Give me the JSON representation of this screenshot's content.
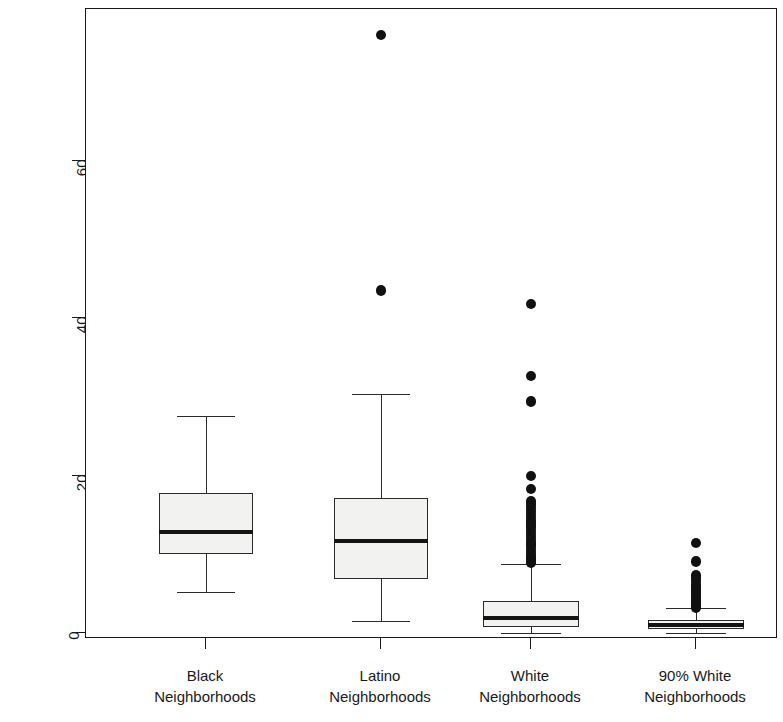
{
  "chart_data": {
    "type": "box",
    "title": "",
    "xlabel": "",
    "ylabel": "Prison Admission Rate",
    "ylim": [
      -1.5,
      79
    ],
    "yticks": [
      0,
      20,
      40,
      60
    ],
    "ytick_labels": [
      "0",
      "20",
      "40",
      "60"
    ],
    "grid": false,
    "legend": "none",
    "categories": [
      "Black\nNeighborhoods",
      "Latino\nNeighborhoods",
      "White\nNeighborhoods",
      "90% White\nNeighborhoods"
    ],
    "boxes": [
      {
        "name": "Black Neighborhoods",
        "label_line1": "Black",
        "label_line2": "Neighborhoods",
        "whisker_low": 5.2,
        "q1": 10.0,
        "median": 12.8,
        "q3": 17.8,
        "whisker_high": 27.5,
        "outliers": []
      },
      {
        "name": "Latino Neighborhoods",
        "label_line1": "Latino",
        "label_line2": "Neighborhoods",
        "whisker_low": 1.5,
        "q1": 6.9,
        "median": 11.7,
        "q3": 17.2,
        "whisker_high": 30.3,
        "outliers": [
          75.9,
          43.5
        ]
      },
      {
        "name": "White Neighborhoods",
        "label_line1": "White",
        "label_line2": "Neighborhoods",
        "whisker_low": 0.0,
        "q1": 0.7,
        "median": 1.9,
        "q3": 4.1,
        "whisker_high": 8.8,
        "outliers": [
          41.8,
          32.6,
          29.4,
          19.9,
          18.3,
          16.7,
          16.3,
          15.9,
          15.5,
          15.1,
          14.7,
          14.3,
          13.9,
          13.5,
          13.1,
          12.7,
          12.3,
          11.9,
          11.5,
          11.1,
          10.7,
          10.3,
          9.9,
          9.6,
          9.3,
          9.1,
          8.9
        ]
      },
      {
        "name": "90% White Neighborhoods",
        "label_line1": "90% White",
        "label_line2": "Neighborhoods",
        "whisker_low": 0.0,
        "q1": 0.5,
        "median": 1.0,
        "q3": 1.7,
        "whisker_high": 3.2,
        "outliers": [
          11.4,
          9.1,
          7.3,
          6.9,
          6.5,
          6.1,
          5.8,
          5.5,
          5.2,
          4.9,
          4.6,
          4.3,
          4.0,
          3.7,
          3.4,
          3.25
        ]
      }
    ]
  },
  "axis": {
    "y_label": "Prison Admission Rate",
    "y_ticks": [
      "0",
      "20",
      "40",
      "60"
    ]
  }
}
